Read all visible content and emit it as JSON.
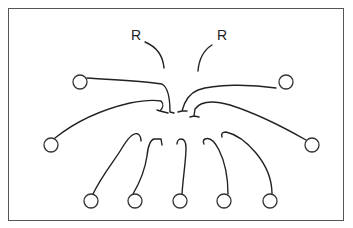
{
  "diagram": {
    "labels": [
      {
        "id": "r-left",
        "text": "R",
        "x": 131,
        "y": 28
      },
      {
        "id": "r-right",
        "text": "R",
        "x": 217,
        "y": 28
      }
    ],
    "colors": {
      "stroke": "#222222",
      "border": "#555555",
      "background": "#ffffff"
    },
    "nodes": [
      {
        "id": "upper-left",
        "cx": 80,
        "cy": 82,
        "r": 7
      },
      {
        "id": "upper-right",
        "cx": 286,
        "cy": 82,
        "r": 7
      },
      {
        "id": "mid-left",
        "cx": 51,
        "cy": 145,
        "r": 7
      },
      {
        "id": "mid-right",
        "cx": 312,
        "cy": 145,
        "r": 7
      },
      {
        "id": "bottom-1",
        "cx": 91,
        "cy": 201,
        "r": 7
      },
      {
        "id": "bottom-2",
        "cx": 135,
        "cy": 201,
        "r": 7
      },
      {
        "id": "bottom-3",
        "cx": 180,
        "cy": 201,
        "r": 7
      },
      {
        "id": "bottom-4",
        "cx": 224,
        "cy": 201,
        "r": 7
      },
      {
        "id": "bottom-5",
        "cx": 270,
        "cy": 201,
        "r": 7
      }
    ]
  }
}
